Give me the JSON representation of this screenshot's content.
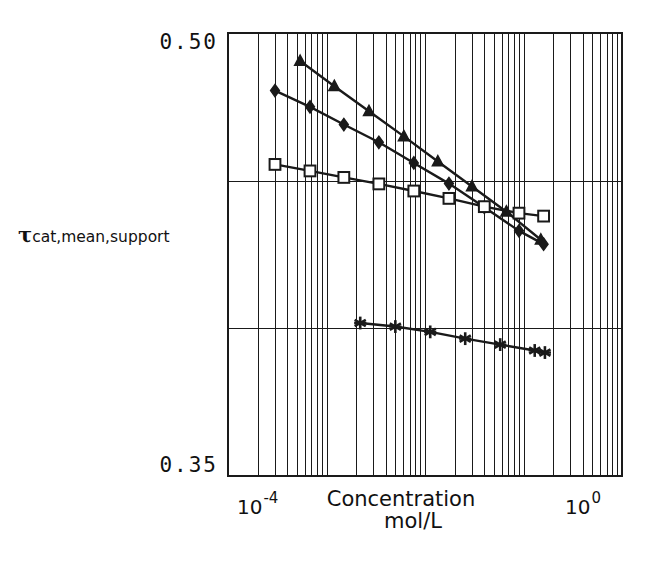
{
  "figure": {
    "background": "#ffffff",
    "ink_color": "#1a1a1a"
  },
  "axes": {
    "y_title_symbol": "τ",
    "y_title_subscript": "cat,mean,support",
    "y_tick_top": "0.50",
    "y_tick_bottom": "0.35",
    "x_title_line1": "Concentration",
    "x_title_line2": "mol/L",
    "x_tick_left_mantissa": "10",
    "x_tick_left_exponent": "-4",
    "x_tick_right_mantissa": "10",
    "x_tick_right_exponent": "0"
  },
  "chart_data": {
    "type": "line",
    "title": "",
    "subtitle": "",
    "xlabel": "Concentration mol/L",
    "ylabel": "τcat,mean,support",
    "xscale": "log",
    "yscale": "linear",
    "xlim": [
      0.0001,
      1.0
    ],
    "ylim": [
      0.35,
      0.5
    ],
    "xticks": [
      0.0001,
      1.0
    ],
    "xticklabels": [
      "10^-4",
      "10^0"
    ],
    "yticks": [
      0.35,
      0.4,
      0.45,
      0.5
    ],
    "yticklabels": [
      "0.35",
      "",
      "",
      "0.50"
    ],
    "grid": {
      "x_minor_log_decades": true,
      "y_major_lines": [
        0.35,
        0.4,
        0.45,
        0.5
      ],
      "grid_color": "#1a1a1a"
    },
    "legend": {
      "visible": false,
      "position": "none"
    },
    "series": [
      {
        "name": "series-triangle",
        "marker": "triangle",
        "marker_filled": true,
        "color": "#1a1a1a",
        "x": [
          0.00054,
          0.0012,
          0.0027,
          0.0061,
          0.0135,
          0.03,
          0.067,
          0.15
        ],
        "y": [
          0.4905,
          0.482,
          0.4735,
          0.465,
          0.4565,
          0.448,
          0.4395,
          0.43
        ]
      },
      {
        "name": "series-diamond",
        "marker": "diamond",
        "marker_filled": true,
        "color": "#1a1a1a",
        "x": [
          0.0003,
          0.00068,
          0.0015,
          0.0034,
          0.0077,
          0.0175,
          0.04,
          0.09,
          0.16
        ],
        "y": [
          0.4805,
          0.475,
          0.469,
          0.463,
          0.456,
          0.449,
          0.441,
          0.433,
          0.4285
        ]
      },
      {
        "name": "series-square",
        "marker": "square",
        "marker_filled": false,
        "color": "#1a1a1a",
        "x": [
          0.0003,
          0.00068,
          0.0015,
          0.0034,
          0.0077,
          0.0175,
          0.04,
          0.09,
          0.16
        ],
        "y": [
          0.4555,
          0.4533,
          0.4511,
          0.4489,
          0.4465,
          0.444,
          0.4412,
          0.439,
          0.438
        ]
      },
      {
        "name": "series-star",
        "marker": "asterisk",
        "marker_filled": true,
        "color": "#1a1a1a",
        "x": [
          0.0022,
          0.005,
          0.0113,
          0.0256,
          0.058,
          0.13,
          0.165
        ],
        "y": [
          0.4018,
          0.4006,
          0.3988,
          0.3965,
          0.3945,
          0.3925,
          0.3918
        ]
      }
    ]
  }
}
